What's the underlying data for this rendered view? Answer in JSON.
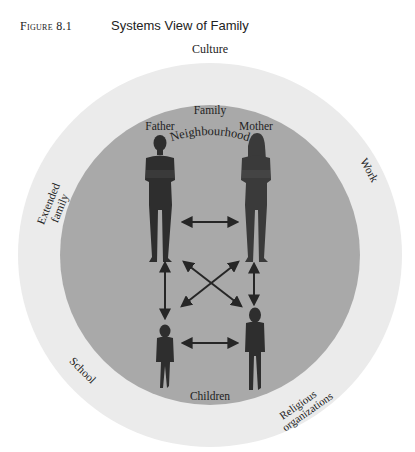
{
  "figure": {
    "label": "Figure 8.1",
    "title": "Systems View of Family"
  },
  "rings": {
    "culture": "Culture",
    "neighbourhood": "Neighbourhood",
    "extended_family_line1": "Extended",
    "extended_family_line2": "family",
    "work": "Work",
    "school": "School",
    "religious_line1": "Religious",
    "religious_line2": "organizations",
    "family": "Family"
  },
  "members": {
    "father": "Father",
    "mother": "Mother",
    "children": "Children"
  },
  "colors": {
    "outer_ring": "#ebebeb",
    "inner_circle": "#a9a9a9",
    "figures": "#2e2e2e",
    "arrows": "#262626"
  }
}
